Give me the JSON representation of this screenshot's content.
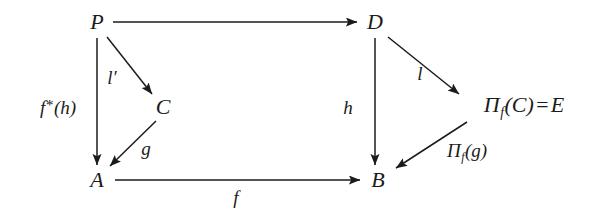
{
  "diagram": {
    "type": "commutative-diagram",
    "background_color": "#ffffff",
    "stroke_color": "#1b1b1b",
    "nodes": [
      {
        "id": "P",
        "label": "P",
        "x": 97,
        "y": 22
      },
      {
        "id": "D",
        "label": "D",
        "x": 375,
        "y": 22
      },
      {
        "id": "C",
        "label": "C",
        "x": 163,
        "y": 107
      },
      {
        "id": "E",
        "label": "Π",
        "sub": "f",
        "rest": "(C)",
        "eq": "=",
        "rhs": "E",
        "x": 524,
        "y": 107
      },
      {
        "id": "A",
        "label": "A",
        "x": 97,
        "y": 180
      },
      {
        "id": "B",
        "label": "B",
        "x": 378,
        "y": 180
      }
    ],
    "edges": [
      {
        "id": "P-D",
        "from": "P",
        "to": "D",
        "label": "",
        "x1": 113,
        "y1": 22,
        "x2": 357,
        "y2": 22
      },
      {
        "id": "P-C",
        "from": "P",
        "to": "C",
        "label": "l′",
        "x1": 107,
        "y1": 36,
        "x2": 152,
        "y2": 94
      },
      {
        "id": "P-A",
        "from": "P",
        "to": "A",
        "label": "f*(h)",
        "x1": 97,
        "y1": 38,
        "x2": 97,
        "y2": 165
      },
      {
        "id": "C-A",
        "from": "C",
        "to": "A",
        "label": "g",
        "x1": 155,
        "y1": 121,
        "x2": 110,
        "y2": 166
      },
      {
        "id": "A-B",
        "from": "A",
        "to": "B",
        "label": "f",
        "x1": 114,
        "y1": 180,
        "x2": 360,
        "y2": 180
      },
      {
        "id": "D-E",
        "from": "D",
        "to": "E",
        "label": "l",
        "x1": 388,
        "y1": 36,
        "x2": 458,
        "y2": 94
      },
      {
        "id": "D-B",
        "from": "D",
        "to": "B",
        "label": "h",
        "x1": 375,
        "y1": 38,
        "x2": 375,
        "y2": 165
      },
      {
        "id": "E-B",
        "from": "E",
        "to": "B",
        "label": "Π_f(g)",
        "x1": 466,
        "y1": 121,
        "x2": 394,
        "y2": 168
      }
    ],
    "edge_labels": {
      "l_prime": {
        "text": "l",
        "prime": "′",
        "x": 112,
        "y": 77
      },
      "f_star_h": {
        "pre": "f",
        "star": "*",
        "post": "(h)",
        "x": 58,
        "y": 107
      },
      "g": {
        "text": "g",
        "x": 146,
        "y": 148
      },
      "f": {
        "text": "f",
        "x": 236,
        "y": 197
      },
      "h": {
        "text": "h",
        "x": 348,
        "y": 107
      },
      "l": {
        "text": "l",
        "x": 420,
        "y": 73
      },
      "pi_f_g": {
        "pi": "Π",
        "sub": "f",
        "rest": "(g)",
        "x": 465,
        "y": 152
      }
    }
  }
}
